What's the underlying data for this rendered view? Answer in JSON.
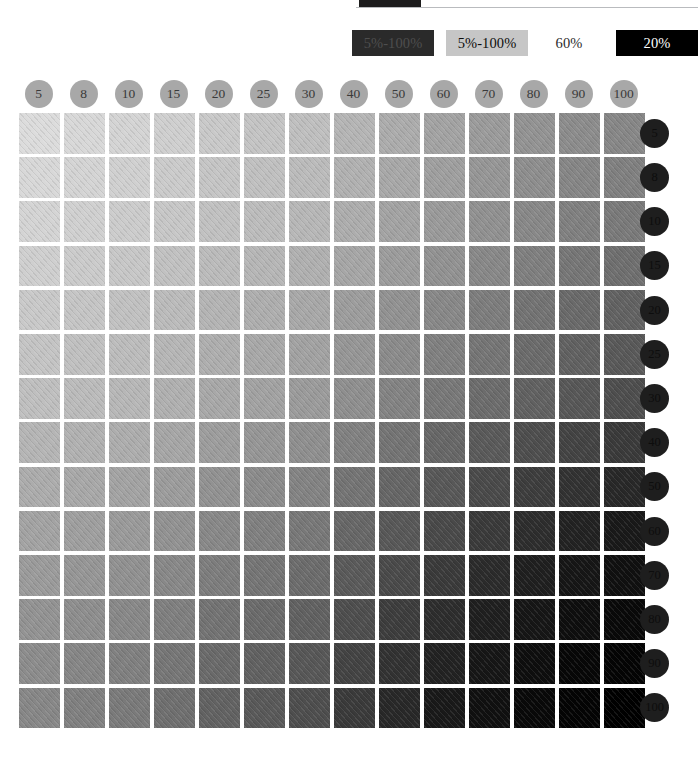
{
  "chart_data": {
    "type": "heatmap",
    "title": "",
    "xlabel": "",
    "ylabel": "",
    "grid": false,
    "legend_position": "top-right",
    "categories": [
      "5",
      "8",
      "10",
      "15",
      "20",
      "25",
      "30",
      "40",
      "50",
      "60",
      "70",
      "80",
      "90",
      "100"
    ],
    "row_categories": [
      "5",
      "8",
      "10",
      "15",
      "20",
      "25",
      "30",
      "40",
      "50",
      "60",
      "70",
      "80",
      "90",
      "100"
    ],
    "cell_tints": [
      [
        "#dcdcdc",
        "#d8d8d8",
        "#d4d4d4",
        "#cfcfcf",
        "#c9c9c9",
        "#c4c4c4",
        "#bfbfbf",
        "#b5b5b5",
        "#acacac",
        "#a3a3a3",
        "#9b9b9b",
        "#939393",
        "#8c8c8c",
        "#878787"
      ],
      [
        "#d8d8d8",
        "#d4d4d4",
        "#d0d0d0",
        "#cbcbcb",
        "#c5c5c5",
        "#c0c0c0",
        "#bbbbbb",
        "#b1b1b1",
        "#a8a8a8",
        "#9f9f9f",
        "#969696",
        "#8e8e8e",
        "#868686",
        "#808080"
      ],
      [
        "#d4d4d4",
        "#d0d0d0",
        "#cccccc",
        "#c7c7c7",
        "#c1c1c1",
        "#bcbcbc",
        "#b7b7b7",
        "#adadad",
        "#a3a3a3",
        "#9a9a9a",
        "#919191",
        "#888888",
        "#808080",
        "#7a7a7a"
      ],
      [
        "#cfcfcf",
        "#cbcbcb",
        "#c7c7c7",
        "#c1c1c1",
        "#bbbbbb",
        "#b6b6b6",
        "#b0b0b0",
        "#a6a6a6",
        "#9c9c9c",
        "#929292",
        "#888888",
        "#7f7f7f",
        "#767676",
        "#6f6f6f"
      ],
      [
        "#c9c9c9",
        "#c5c5c5",
        "#c1c1c1",
        "#bbbbbb",
        "#b4b4b4",
        "#aeaeae",
        "#a8a8a8",
        "#9d9d9d",
        "#929292",
        "#888888",
        "#7d7d7d",
        "#737373",
        "#6a6a6a",
        "#626262"
      ],
      [
        "#c4c4c4",
        "#c0c0c0",
        "#bcbcbc",
        "#b6b6b6",
        "#aeaeae",
        "#a8a8a8",
        "#a2a2a2",
        "#969696",
        "#8b8b8b",
        "#808080",
        "#757575",
        "#6b6b6b",
        "#616161",
        "#595959"
      ],
      [
        "#bfbfbf",
        "#bbbbbb",
        "#b7b7b7",
        "#b0b0b0",
        "#a8a8a8",
        "#a2a2a2",
        "#9b9b9b",
        "#8f8f8f",
        "#838383",
        "#787878",
        "#6c6c6c",
        "#616161",
        "#575757",
        "#4e4e4e"
      ],
      [
        "#b5b5b5",
        "#b1b1b1",
        "#adadad",
        "#a6a6a6",
        "#9d9d9d",
        "#969696",
        "#8f8f8f",
        "#818181",
        "#747474",
        "#676767",
        "#5a5a5a",
        "#4e4e4e",
        "#434343",
        "#3a3a3a"
      ],
      [
        "#acacac",
        "#a8a8a8",
        "#a3a3a3",
        "#9c9c9c",
        "#929292",
        "#8b8b8b",
        "#838383",
        "#747474",
        "#666666",
        "#585858",
        "#4a4a4a",
        "#3d3d3d",
        "#323232",
        "#282828"
      ],
      [
        "#a3a3a3",
        "#9f9f9f",
        "#9a9a9a",
        "#929292",
        "#888888",
        "#808080",
        "#787878",
        "#676767",
        "#585858",
        "#494949",
        "#3a3a3a",
        "#2d2d2d",
        "#222222",
        "#191919"
      ],
      [
        "#9b9b9b",
        "#969696",
        "#919191",
        "#888888",
        "#7d7d7d",
        "#757575",
        "#6c6c6c",
        "#5a5a5a",
        "#4a4a4a",
        "#3a3a3a",
        "#2b2b2b",
        "#1f1f1f",
        "#161616",
        "#101010"
      ],
      [
        "#939393",
        "#8e8e8e",
        "#888888",
        "#7f7f7f",
        "#737373",
        "#6b6b6b",
        "#616161",
        "#4e4e4e",
        "#3d3d3d",
        "#2d2d2d",
        "#1f1f1f",
        "#161616",
        "#0e0e0e",
        "#090909"
      ],
      [
        "#8c8c8c",
        "#868686",
        "#808080",
        "#767676",
        "#6a6a6a",
        "#616161",
        "#575757",
        "#434343",
        "#323232",
        "#222222",
        "#161616",
        "#0e0e0e",
        "#070707",
        "#040404"
      ],
      [
        "#878787",
        "#808080",
        "#7a7a7a",
        "#6f6f6f",
        "#626262",
        "#595959",
        "#4e4e4e",
        "#3a3a3a",
        "#282828",
        "#191919",
        "#101010",
        "#090909",
        "#040404",
        "#000000"
      ]
    ]
  },
  "top_tab": {
    "color": "#1c1c1c"
  },
  "legend": {
    "items": [
      {
        "label": "5%-100%",
        "bg": "#2a2a2a",
        "fg": "#4e4e4e",
        "x": 0,
        "width": 82
      },
      {
        "label": "5%-100%",
        "bg": "#c6c6c6",
        "fg": "#0d0d0d",
        "x": 94,
        "width": 82
      },
      {
        "label": "60%",
        "bg": "transparent",
        "fg": "#2b2b2b",
        "x": 188,
        "width": 58
      },
      {
        "label": "20%",
        "bg": "#000000",
        "fg": "#ffffff",
        "x": 264,
        "width": 82
      }
    ]
  },
  "col_headers": {
    "circle_fill": "#a8a8a8",
    "labels": [
      "5",
      "8",
      "10",
      "15",
      "20",
      "25",
      "30",
      "40",
      "50",
      "60",
      "70",
      "80",
      "90",
      "100"
    ]
  },
  "row_headers": {
    "circle_fill": "#1e1e1e",
    "labels": [
      "5",
      "8",
      "10",
      "15",
      "20",
      "25",
      "30",
      "40",
      "50",
      "60",
      "70",
      "80",
      "90",
      "100"
    ]
  }
}
